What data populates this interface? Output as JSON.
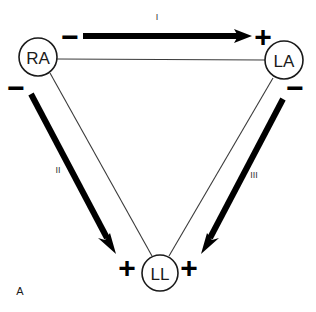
{
  "figure": {
    "panel_letter": "A",
    "background_color": "#ffffff",
    "ink_color": "#000000",
    "side_line_color": "#3a3a3a"
  },
  "nodes": [
    {
      "id": "RA",
      "label": "RA",
      "cx": 38,
      "cy": 57,
      "r": 19
    },
    {
      "id": "LA",
      "label": "LA",
      "cx": 284,
      "cy": 60,
      "r": 19
    },
    {
      "id": "LL",
      "label": "LL",
      "cx": 160,
      "cy": 273,
      "r": 18
    }
  ],
  "leads": [
    {
      "id": "I",
      "label": "I",
      "label_x": 157,
      "label_y": 17,
      "from": "RA",
      "to": "LA",
      "negative_sign": "−",
      "negative_x": 70,
      "negative_y": 36,
      "positive_sign": "+",
      "positive_x": 263,
      "positive_y": 36,
      "arrow_x1": 83,
      "arrow_y1": 36,
      "arrow_x2": 240,
      "arrow_y2": 36,
      "tip_x": 252,
      "tip_y": 36
    },
    {
      "id": "II",
      "label": "II",
      "label_x": 58,
      "label_y": 170,
      "from": "RA",
      "to": "LL",
      "negative_sign": "−",
      "negative_x": 16,
      "negative_y": 87,
      "positive_sign": "+",
      "positive_x": 127,
      "positive_y": 267,
      "arrow_x1": 31,
      "arrow_y1": 94,
      "arrow_x2": 106,
      "arrow_y2": 236,
      "tip_x": 116,
      "tip_y": 254
    },
    {
      "id": "III",
      "label": "III",
      "label_x": 254,
      "label_y": 175,
      "from": "LA",
      "to": "LL",
      "negative_sign": "−",
      "negative_x": 295,
      "negative_y": 87,
      "positive_sign": "+",
      "positive_x": 189,
      "positive_y": 267,
      "arrow_x1": 283,
      "arrow_y1": 99,
      "arrow_x2": 211,
      "arrow_y2": 236,
      "tip_x": 201,
      "tip_y": 254
    }
  ],
  "sides": [
    {
      "id": "ra-la",
      "x1": 57,
      "y1": 59,
      "x2": 265,
      "y2": 60
    },
    {
      "id": "ra-ll",
      "x1": 50,
      "y1": 73,
      "x2": 152,
      "y2": 256
    },
    {
      "id": "la-ll",
      "x1": 273,
      "y1": 78,
      "x2": 169,
      "y2": 256
    }
  ]
}
